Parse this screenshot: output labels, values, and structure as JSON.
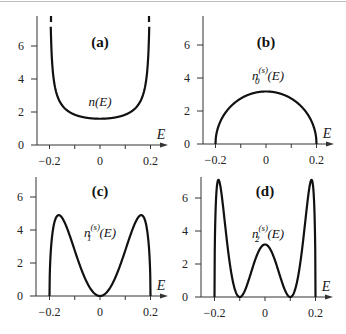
{
  "figure": {
    "panels": [
      {
        "id": "a",
        "label": "(a)",
        "curve_label_main": "n(E)",
        "curve_label_sup": "",
        "curve_label_sub": ""
      },
      {
        "id": "b",
        "label": "(b)",
        "curve_label_main": "n",
        "curve_label_sup": "(s)",
        "curve_label_sub": "0",
        "curve_label_tail": "(E)"
      },
      {
        "id": "c",
        "label": "(c)",
        "curve_label_main": "n",
        "curve_label_sup": "(s)",
        "curve_label_sub": "1",
        "curve_label_tail": "(E)"
      },
      {
        "id": "d",
        "label": "(d)",
        "curve_label_main": "n",
        "curve_label_sup": "(s)",
        "curve_label_sub": "2",
        "curve_label_tail": "(E)"
      }
    ],
    "x_axis_label": "E",
    "x_ticks": [
      "−0.2",
      "0",
      "0.2"
    ],
    "y_ticks": [
      "0",
      "2",
      "4",
      "6"
    ]
  },
  "chart_data": [
    {
      "type": "line",
      "title": "(a)",
      "xlabel": "E",
      "ylabel": "",
      "series": [
        {
          "name": "n(E)",
          "x": [
            -0.199,
            -0.198,
            -0.196,
            -0.193,
            -0.19,
            -0.185,
            -0.18,
            -0.17,
            -0.16,
            -0.14,
            -0.12,
            -0.1,
            -0.08,
            -0.05,
            0,
            0.05,
            0.08,
            0.1,
            0.12,
            0.14,
            0.16,
            0.17,
            0.18,
            0.185,
            0.19,
            0.193,
            0.196,
            0.198,
            0.199
          ],
          "y": [
            15.9,
            7.96,
            8.0,
            6.1,
            5.1,
            4.19,
            3.65,
            3.02,
            2.65,
            2.23,
            1.99,
            1.84,
            1.74,
            1.64,
            1.59,
            1.64,
            1.74,
            1.84,
            1.99,
            2.23,
            2.65,
            3.02,
            3.65,
            4.19,
            5.1,
            6.1,
            8.0,
            7.96,
            15.9
          ]
        }
      ],
      "xlim": [
        -0.25,
        0.25
      ],
      "ylim": [
        0,
        7.2
      ],
      "x_ticks": [
        -0.2,
        0,
        0.2
      ],
      "y_ticks": [
        0,
        2,
        4,
        6
      ],
      "grid": false
    },
    {
      "type": "line",
      "title": "(b)",
      "xlabel": "E",
      "ylabel": "",
      "series": [
        {
          "name": "n0^(s)(E)",
          "x": [
            -0.2,
            -0.19,
            -0.18,
            -0.16,
            -0.14,
            -0.12,
            -0.1,
            -0.08,
            -0.05,
            0,
            0.05,
            0.08,
            0.1,
            0.12,
            0.14,
            0.16,
            0.18,
            0.19,
            0.2
          ],
          "y": [
            0,
            0.99,
            1.39,
            1.91,
            2.27,
            2.55,
            2.76,
            2.92,
            3.08,
            3.18,
            3.08,
            2.92,
            2.76,
            2.55,
            2.27,
            1.91,
            1.39,
            0.99,
            0
          ]
        }
      ],
      "xlim": [
        -0.25,
        0.25
      ],
      "ylim": [
        0,
        7.2
      ],
      "x_ticks": [
        -0.2,
        0,
        0.2
      ],
      "y_ticks": [
        0,
        2,
        4,
        6
      ],
      "grid": false
    },
    {
      "type": "line",
      "title": "(c)",
      "xlabel": "E",
      "ylabel": "",
      "series": [
        {
          "name": "n1^(s)(E)",
          "x": [
            -0.2,
            -0.19,
            -0.18,
            -0.163,
            -0.14,
            -0.12,
            -0.1,
            -0.08,
            -0.05,
            0,
            0.05,
            0.08,
            0.1,
            0.12,
            0.14,
            0.163,
            0.18,
            0.19,
            0.2
          ],
          "y": [
            0,
            3.57,
            4.5,
            4.9,
            4.45,
            3.67,
            2.76,
            1.87,
            0.77,
            0,
            0.77,
            1.87,
            2.76,
            3.67,
            4.45,
            4.9,
            4.5,
            3.57,
            0
          ]
        }
      ],
      "xlim": [
        -0.25,
        0.25
      ],
      "ylim": [
        0,
        7.2
      ],
      "x_ticks": [
        -0.2,
        0,
        0.2
      ],
      "y_ticks": [
        0,
        2,
        4,
        6
      ],
      "grid": false
    },
    {
      "type": "line",
      "title": "(d)",
      "xlabel": "E",
      "ylabel": "",
      "series": [
        {
          "name": "n2^(s)(E)",
          "x": [
            -0.2,
            -0.19,
            -0.18,
            -0.16,
            -0.14,
            -0.12,
            -0.1,
            -0.08,
            -0.05,
            0,
            0.05,
            0.08,
            0.1,
            0.12,
            0.14,
            0.16,
            0.18,
            0.19,
            0.2
          ],
          "y": [
            0,
            6.6,
            7.1,
            5.6,
            2.43,
            0.48,
            0,
            0.4,
            1.73,
            3.18,
            1.73,
            0.4,
            0,
            0.48,
            2.43,
            5.6,
            7.1,
            6.6,
            0
          ]
        }
      ],
      "xlim": [
        -0.25,
        0.25
      ],
      "ylim": [
        0,
        7.2
      ],
      "x_ticks": [
        -0.2,
        0,
        0.2
      ],
      "y_ticks": [
        0,
        2,
        4,
        6
      ],
      "grid": false
    }
  ]
}
